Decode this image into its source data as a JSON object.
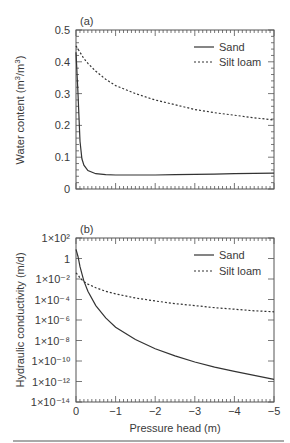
{
  "chart_data": [
    {
      "type": "line",
      "panel_label": "(a)",
      "title": "",
      "xlabel": "Pressure head (m)",
      "ylabel": "Water content (m3/m3)",
      "xlim": [
        0,
        -5
      ],
      "ylim": [
        0,
        0.5
      ],
      "y_ticks": [
        "0",
        "0.1",
        "0.2",
        "0.3",
        "0.4",
        "0.5"
      ],
      "grid": false,
      "legend_position": "upper right",
      "x": [
        0,
        -0.05,
        -0.1,
        -0.15,
        -0.2,
        -0.3,
        -0.5,
        -0.75,
        -1,
        -1.5,
        -2,
        -2.5,
        -3,
        -3.5,
        -4,
        -4.5,
        -5
      ],
      "series": [
        {
          "name": "Sand",
          "style": "solid",
          "values": [
            0.43,
            0.3,
            0.15,
            0.095,
            0.075,
            0.058,
            0.048,
            0.045,
            0.044,
            0.044,
            0.044,
            0.045,
            0.046,
            0.047,
            0.048,
            0.049,
            0.05
          ]
        },
        {
          "name": "Silt loam",
          "style": "dashed",
          "values": [
            0.45,
            0.44,
            0.43,
            0.42,
            0.41,
            0.395,
            0.37,
            0.345,
            0.325,
            0.3,
            0.28,
            0.265,
            0.25,
            0.24,
            0.232,
            0.224,
            0.217
          ]
        }
      ]
    },
    {
      "type": "line",
      "panel_label": "(b)",
      "title": "",
      "xlabel": "Pressure head (m)",
      "ylabel": "Hydraulic conductivity (m/d)",
      "yscale": "log",
      "xlim": [
        0,
        -5
      ],
      "ylim": [
        1e-14,
        100
      ],
      "x_ticks": [
        "0",
        "−1",
        "−2",
        "−3",
        "−4",
        "−5"
      ],
      "y_ticks": [
        "1×10⁻¹⁴",
        "1×10⁻¹²",
        "1×10⁻¹⁰",
        "1×10⁻⁸",
        "1×10⁻⁶",
        "1×10⁻⁴",
        "1×10⁻²",
        "1",
        "1×10²"
      ],
      "grid": false,
      "legend_position": "upper right",
      "x": [
        0,
        -0.05,
        -0.1,
        -0.2,
        -0.3,
        -0.5,
        -0.75,
        -1,
        -1.5,
        -2,
        -2.5,
        -3,
        -3.5,
        -4,
        -4.5,
        -5
      ],
      "series": [
        {
          "name": "Sand",
          "style": "solid",
          "log10_values": [
            0.9,
            0.2,
            -0.8,
            -2.2,
            -3.2,
            -4.6,
            -5.8,
            -6.7,
            -7.9,
            -8.8,
            -9.5,
            -10.1,
            -10.6,
            -11.0,
            -11.4,
            -11.8
          ]
        },
        {
          "name": "Silt loam",
          "style": "dashed",
          "log10_values": [
            -1.4,
            -1.6,
            -1.9,
            -2.25,
            -2.5,
            -2.85,
            -3.2,
            -3.45,
            -3.85,
            -4.15,
            -4.4,
            -4.6,
            -4.8,
            -4.95,
            -5.1,
            -5.2
          ]
        }
      ]
    }
  ],
  "panel_a": {
    "label": "(a)",
    "ylabel": "Water content (m3/m3)",
    "y_ticks": [
      "0",
      "0.1",
      "0.2",
      "0.3",
      "0.4",
      "0.5"
    ],
    "legend": [
      {
        "name": "Sand"
      },
      {
        "name": "Silt loam"
      }
    ]
  },
  "panel_b": {
    "label": "(b)",
    "ylabel": "Hydraulic conductivity (m/d)",
    "legend": [
      {
        "name": "Sand"
      },
      {
        "name": "Silt loam"
      }
    ]
  },
  "x_axis": {
    "label": "Pressure head (m)",
    "ticks": [
      "0",
      "−1",
      "−2",
      "−3",
      "−4",
      "−5"
    ]
  },
  "colors": {
    "line": "#333333",
    "frame": "#555555",
    "text": "#3a3a3a"
  }
}
